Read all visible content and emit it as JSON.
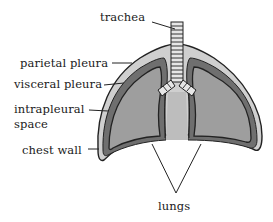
{
  "diagram": {
    "labels": {
      "trachea": "trachea",
      "parietal_pleura": "parietal pleura",
      "visceral_pleura": "visceral pleura",
      "intrapleural_space_line1": "intrapleural",
      "intrapleural_space_line2": "space",
      "chest_wall": "chest wall",
      "lungs": "lungs"
    },
    "colors": {
      "chest_wall": "#cfcfcf",
      "pleura_band": "#6f6f6f",
      "lung_fill": "#9e9e9e",
      "mediastinum": "#bdbdbd",
      "trachea_fill": "#e6e6e6",
      "outline": "#222222",
      "leader_line": "#222222"
    }
  }
}
